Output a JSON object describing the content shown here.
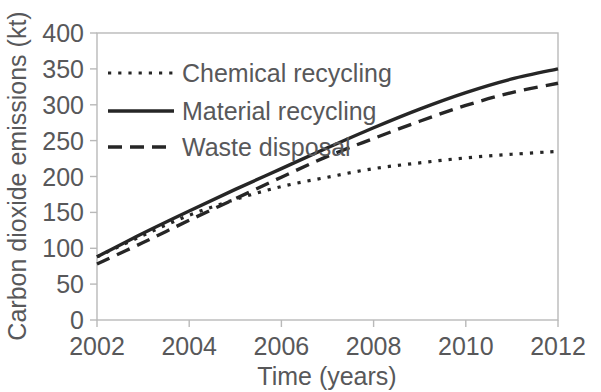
{
  "chart_data": {
    "type": "line",
    "title": "",
    "xlabel": "Time (years)",
    "ylabel": "Carbon dioxide emissions (kt)",
    "xlim": [
      2002,
      2012
    ],
    "ylim": [
      0,
      400
    ],
    "xticks": [
      2002,
      2004,
      2006,
      2008,
      2010,
      2012
    ],
    "yticks": [
      0,
      50,
      100,
      150,
      200,
      250,
      300,
      350,
      400
    ],
    "xtick_labels": [
      "2002",
      "2004",
      "2006",
      "2008",
      "2010",
      "2012"
    ],
    "ytick_labels": [
      "0",
      "50",
      "100",
      "150",
      "200",
      "250",
      "300",
      "350",
      "400"
    ],
    "grid": false,
    "legend_position": "upper-left-inside",
    "x": [
      2002,
      2003,
      2004,
      2005,
      2006,
      2007,
      2008,
      2009,
      2010,
      2011,
      2012
    ],
    "series": [
      {
        "name": "Chemical recycling",
        "style": "dotted",
        "color": "#262626",
        "values": [
          88,
          118,
          146,
          168,
          186,
          199,
          211,
          219,
          226,
          231,
          235
        ]
      },
      {
        "name": "Material recycling",
        "style": "solid",
        "color": "#262626",
        "values": [
          88,
          121,
          152,
          182,
          211,
          240,
          268,
          294,
          317,
          336,
          350
        ]
      },
      {
        "name": "Waste disposal",
        "style": "dashed",
        "color": "#262626",
        "values": [
          78,
          108,
          139,
          169,
          199,
          228,
          253,
          277,
          299,
          317,
          330
        ]
      }
    ]
  },
  "legend": {
    "items": [
      {
        "label": "Chemical recycling",
        "marker": "dotted-line-swatch"
      },
      {
        "label": "Material recycling",
        "marker": "solid-line-swatch"
      },
      {
        "label": "Waste disposal",
        "marker": "dashed-line-swatch"
      }
    ]
  },
  "axes": {
    "x_title": "Time (years)",
    "y_title": "Carbon dioxide emissions (kt)"
  },
  "colors": {
    "line": "#262626",
    "frame": "#b9b9b9",
    "text": "#58585a",
    "background": "#ffffff"
  }
}
